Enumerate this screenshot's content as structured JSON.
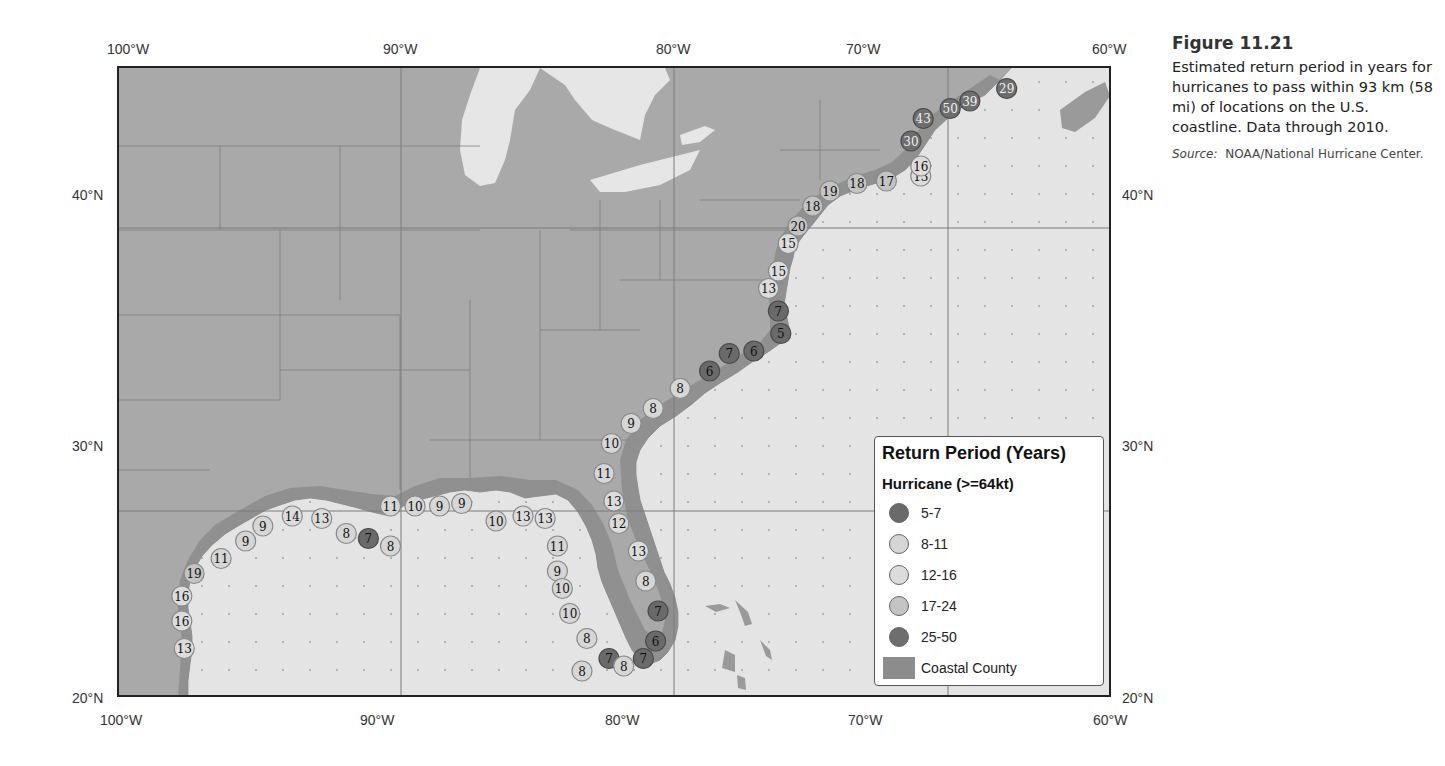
{
  "figure": {
    "number": "Figure 11.21",
    "caption": "Estimated return period in years for hurricanes to pass within 93 km (58 mi) of locations on the U.S. coastline. Data through 2010.",
    "source_label": "Source:",
    "source_text": "NOAA/National Hurricane Center."
  },
  "axes": {
    "lon_top": [
      "100°W",
      "90°W",
      "80°W",
      "70°W",
      "60°W"
    ],
    "lon_bottom": [
      "100°W",
      "90°W",
      "80°W",
      "70°W",
      "60°W"
    ],
    "lat_left": [
      "40°N",
      "30°N",
      "20°N"
    ],
    "lat_right": [
      "40°N",
      "30°N",
      "20°N"
    ]
  },
  "colors": {
    "land": "#a9a9a9",
    "ocean": "#e4e4e4",
    "lakes": "#e6e6e6",
    "coastal_county": "#8c8c8c",
    "frame": "#222222",
    "grid": "#7a7a7a",
    "class_5_7": "#6a6a6a",
    "class_8_11": "#d6d6d6",
    "class_12_16": "#dcdcdc",
    "class_17_24": "#c4c4c4",
    "class_25_50": "#6e6e6e"
  },
  "legend": {
    "title": "Return Period (Years)",
    "subtitle": "Hurricane (>=64kt)",
    "items": [
      {
        "label": "5-7",
        "color": "#6a6a6a"
      },
      {
        "label": "8-11",
        "color": "#d6d6d6"
      },
      {
        "label": "12-16",
        "color": "#dcdcdc"
      },
      {
        "label": "17-24",
        "color": "#c4c4c4"
      },
      {
        "label": "25-50",
        "color": "#6e6e6e"
      }
    ],
    "county_label": "Coastal County"
  },
  "markers": [
    {
      "lon": -97.3,
      "lat": 21.9,
      "value": 13
    },
    {
      "lon": -97.4,
      "lat": 23.0,
      "value": 16
    },
    {
      "lon": -97.4,
      "lat": 24.0,
      "value": 16
    },
    {
      "lon": -96.9,
      "lat": 24.9,
      "value": 19
    },
    {
      "lon": -95.8,
      "lat": 25.5,
      "value": 11
    },
    {
      "lon": -94.8,
      "lat": 26.2,
      "value": 9
    },
    {
      "lon": -94.1,
      "lat": 26.8,
      "value": 9
    },
    {
      "lon": -92.9,
      "lat": 27.2,
      "value": 14
    },
    {
      "lon": -91.7,
      "lat": 27.1,
      "value": 13
    },
    {
      "lon": -90.7,
      "lat": 26.5,
      "value": 8
    },
    {
      "lon": -89.8,
      "lat": 26.3,
      "value": 7
    },
    {
      "lon": -88.9,
      "lat": 26.0,
      "value": 8
    },
    {
      "lon": -88.9,
      "lat": 27.6,
      "value": 11
    },
    {
      "lon": -87.9,
      "lat": 27.6,
      "value": 10
    },
    {
      "lon": -86.9,
      "lat": 27.6,
      "value": 9
    },
    {
      "lon": -86.0,
      "lat": 27.7,
      "value": 9
    },
    {
      "lon": -84.6,
      "lat": 27.0,
      "value": 10
    },
    {
      "lon": -83.5,
      "lat": 27.2,
      "value": 13
    },
    {
      "lon": -82.6,
      "lat": 27.1,
      "value": 13
    },
    {
      "lon": -82.1,
      "lat": 26.0,
      "value": 11
    },
    {
      "lon": -82.1,
      "lat": 25.0,
      "value": 9
    },
    {
      "lon": -81.9,
      "lat": 24.3,
      "value": 10
    },
    {
      "lon": -81.6,
      "lat": 23.3,
      "value": 10
    },
    {
      "lon": -80.9,
      "lat": 22.3,
      "value": 8
    },
    {
      "lon": -80.0,
      "lat": 21.5,
      "value": 7
    },
    {
      "lon": -79.4,
      "lat": 21.2,
      "value": 8
    },
    {
      "lon": -81.1,
      "lat": 21.0,
      "value": 8
    },
    {
      "lon": -78.6,
      "lat": 21.5,
      "value": 7
    },
    {
      "lon": -78.1,
      "lat": 22.2,
      "value": 6
    },
    {
      "lon": -78.0,
      "lat": 23.4,
      "value": 7
    },
    {
      "lon": -78.5,
      "lat": 24.6,
      "value": 8
    },
    {
      "lon": -78.8,
      "lat": 25.8,
      "value": 13
    },
    {
      "lon": -79.6,
      "lat": 26.9,
      "value": 12
    },
    {
      "lon": -79.8,
      "lat": 27.8,
      "value": 13
    },
    {
      "lon": -80.2,
      "lat": 28.9,
      "value": 11
    },
    {
      "lon": -79.9,
      "lat": 30.1,
      "value": 10
    },
    {
      "lon": -79.1,
      "lat": 30.9,
      "value": 9
    },
    {
      "lon": -78.2,
      "lat": 31.5,
      "value": 8
    },
    {
      "lon": -77.1,
      "lat": 32.3,
      "value": 8
    },
    {
      "lon": -75.9,
      "lat": 33.0,
      "value": 6
    },
    {
      "lon": -75.1,
      "lat": 33.7,
      "value": 7
    },
    {
      "lon": -74.1,
      "lat": 33.8,
      "value": 6
    },
    {
      "lon": -73.0,
      "lat": 34.5,
      "value": 5
    },
    {
      "lon": -73.1,
      "lat": 35.4,
      "value": 7
    },
    {
      "lon": -73.5,
      "lat": 36.3,
      "value": 13
    },
    {
      "lon": -73.1,
      "lat": 37.0,
      "value": 15
    },
    {
      "lon": -72.7,
      "lat": 38.1,
      "value": 15
    },
    {
      "lon": -72.3,
      "lat": 38.8,
      "value": 20
    },
    {
      "lon": -71.7,
      "lat": 39.6,
      "value": 18
    },
    {
      "lon": -71.0,
      "lat": 40.2,
      "value": 19
    },
    {
      "lon": -69.9,
      "lat": 40.5,
      "value": 18
    },
    {
      "lon": -68.7,
      "lat": 40.6,
      "value": 17
    },
    {
      "lon": -67.3,
      "lat": 40.8,
      "value": 13
    },
    {
      "lon": -67.3,
      "lat": 41.2,
      "value": 16
    },
    {
      "lon": -67.7,
      "lat": 42.2,
      "value": 30
    },
    {
      "lon": -67.2,
      "lat": 43.1,
      "value": 43
    },
    {
      "lon": -66.1,
      "lat": 43.5,
      "value": 50
    },
    {
      "lon": -65.3,
      "lat": 43.8,
      "value": 39
    },
    {
      "lon": -63.8,
      "lat": 44.3,
      "value": 29
    }
  ]
}
